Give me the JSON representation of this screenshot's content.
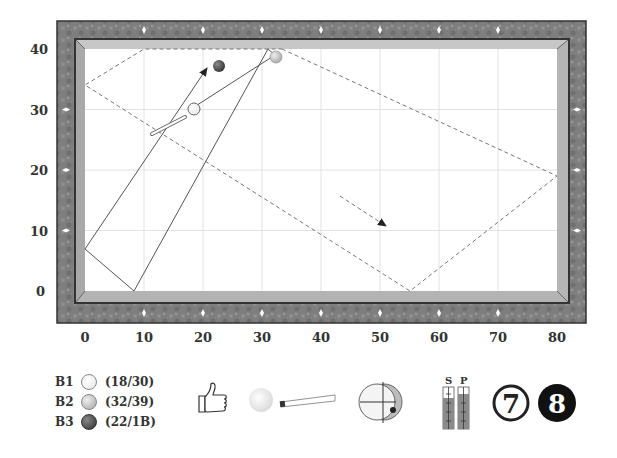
{
  "diagram": {
    "type": "billiards-shot-diagram",
    "table": {
      "x_axis_ticks": [
        "0",
        "10",
        "20",
        "30",
        "40",
        "50",
        "60",
        "70",
        "80"
      ],
      "y_axis_ticks": [
        "0",
        "10",
        "20",
        "30",
        "40"
      ],
      "x_range": [
        0,
        80
      ],
      "y_range": [
        0,
        40
      ],
      "grid": true,
      "colors": {
        "rail": "#7d7d7d",
        "cushion": "#bdbdbd",
        "surface": "#ffffff",
        "grid": "#e2e2e2",
        "diamond": "#ffffff"
      }
    },
    "balls": [
      {
        "id": "B1",
        "label": "B1",
        "coord_text": "(18/30)",
        "x": 18,
        "y": 30,
        "color": "#ffffff"
      },
      {
        "id": "B2",
        "label": "B2",
        "coord_text": "(32/39)",
        "x": 32,
        "y": 39,
        "color": "#cfcfcf"
      },
      {
        "id": "B3",
        "label": "B3",
        "coord_text": "(22/1B)",
        "x": 22,
        "y": 37.5,
        "color": "#555555"
      }
    ],
    "paths": {
      "cue_ball_path": [
        [
          18,
          30
        ],
        [
          32,
          39
        ],
        [
          31,
          40
        ],
        [
          8,
          0
        ],
        [
          0,
          7
        ],
        [
          20.5,
          37.5
        ]
      ],
      "object_ball_path_dashed": [
        [
          32,
          39
        ],
        [
          34,
          40
        ],
        [
          80,
          19
        ],
        [
          55,
          0
        ],
        [
          0,
          34
        ],
        [
          10,
          40
        ],
        [
          34,
          40
        ]
      ],
      "dashed_arrow_end": [
        50,
        11.5
      ]
    },
    "indicators": {
      "thumb": "thumbs-up",
      "spin_ball_offset": {
        "x": 0.3,
        "y": -0.4
      },
      "speed_label": "S",
      "power_label": "P",
      "speed_level": 0.65,
      "power_level": 0.8,
      "number_seven": "7",
      "number_eight": "8"
    }
  }
}
